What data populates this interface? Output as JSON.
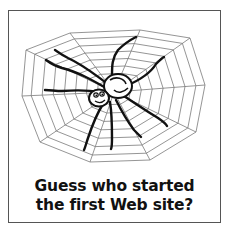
{
  "illustration": {
    "subject": "cartoon spider on a web",
    "icons": [
      "spider-icon",
      "spider-web-icon"
    ]
  },
  "caption": {
    "line1": "Guess who started",
    "line2": "the first Web site?"
  },
  "colors": {
    "ink": "#111111",
    "web": "#777777",
    "border": "#555555",
    "background": "#ffffff"
  }
}
